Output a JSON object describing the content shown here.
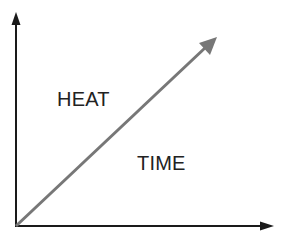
{
  "diagram": {
    "type": "axes-with-diagonal-arrow",
    "labels": {
      "upper_left": "HEAT",
      "lower_right": "TIME"
    },
    "colors": {
      "axes": "#1a1a1a",
      "diagonal_arrow": "#777777",
      "text": "#222222",
      "background": "#ffffff"
    },
    "geometry": {
      "origin": [
        16,
        226
      ],
      "y_axis_tip": [
        16,
        14
      ],
      "x_axis_tip": [
        273,
        226
      ],
      "diagonal_tip": [
        216,
        38
      ]
    }
  }
}
